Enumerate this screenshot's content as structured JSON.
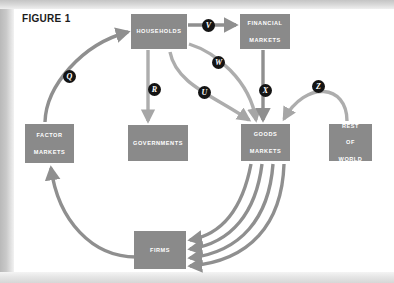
{
  "figure": {
    "title": "FIGURE 1"
  },
  "diagram": {
    "type": "circular-flow-diagram",
    "colors": {
      "node_fill": "#8a8a8a",
      "flow_arrow": "#8f8f8f",
      "badge_fill": "#141414",
      "badge_text": "#ffffff",
      "node_text": "#ffffff",
      "title_text": "#1b1b1b",
      "background": "#ffffff"
    },
    "nodes": [
      {
        "id": "households",
        "label": "HOUSEHOLDS",
        "lines": [
          "HOUSEHOLDS"
        ],
        "x": 131,
        "y": 14,
        "w": 56,
        "h": 35
      },
      {
        "id": "financial-markets",
        "label": "FINANCIAL MARKETS",
        "lines": [
          "FINANCIAL",
          "MARKETS"
        ],
        "x": 240,
        "y": 14,
        "w": 50,
        "h": 35
      },
      {
        "id": "factor-markets",
        "label": "FACTOR MARKETS",
        "lines": [
          "FACTOR",
          "MARKETS"
        ],
        "x": 25,
        "y": 124,
        "w": 49,
        "h": 39
      },
      {
        "id": "governments",
        "label": "GOVERNMENTS",
        "lines": [
          "GOVERNMENTS"
        ],
        "x": 128,
        "y": 125,
        "w": 60,
        "h": 36
      },
      {
        "id": "goods-markets",
        "label": "GOODS MARKETS",
        "lines": [
          "GOODS",
          "MARKETS"
        ],
        "x": 241,
        "y": 124,
        "w": 49,
        "h": 37
      },
      {
        "id": "rest-of-world",
        "label": "REST OF WORLD",
        "lines": [
          "REST",
          "OF",
          "WORLD"
        ],
        "x": 329,
        "y": 124,
        "w": 43,
        "h": 37
      },
      {
        "id": "firms",
        "label": "FIRMS",
        "lines": [
          "FIRMS"
        ],
        "x": 134,
        "y": 231,
        "w": 52,
        "h": 38
      }
    ],
    "flows": [
      {
        "letter": "Q",
        "from": "factor-markets",
        "to": "households",
        "badge_x": 63,
        "badge_y": 70
      },
      {
        "letter": "R",
        "from": "households",
        "to": "governments",
        "badge_x": 148,
        "badge_y": 83
      },
      {
        "letter": "U",
        "from": "households",
        "to": "goods-markets",
        "badge_x": 198,
        "badge_y": 86
      },
      {
        "letter": "V",
        "from": "households",
        "to": "financial-markets",
        "badge_x": 202,
        "badge_y": 19
      },
      {
        "letter": "W",
        "from": "households",
        "to": "goods-markets",
        "badge_x": 212,
        "badge_y": 56
      },
      {
        "letter": "X",
        "from": "financial-markets",
        "to": "goods-markets",
        "badge_x": 259,
        "badge_y": 84
      },
      {
        "letter": "Z",
        "from": "rest-of-world",
        "to": "goods-markets",
        "badge_x": 312,
        "badge_y": 80
      }
    ],
    "unlabeled_flows": [
      {
        "from": "firms",
        "to": "factor-markets",
        "description": "firms to factor markets curve"
      },
      {
        "from": "goods-markets",
        "to": "firms",
        "description": "four parallel curved arrows from goods markets to firms"
      }
    ]
  }
}
